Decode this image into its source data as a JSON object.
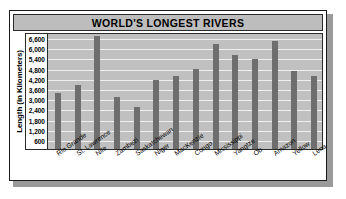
{
  "figure": {
    "title": "WORLD'S LONGEST RIVERS"
  },
  "axes": {
    "ylabel": "Length (in Kilometers)",
    "ytick_labels": [
      "6,600",
      "6,000",
      "5,400",
      "4,800",
      "4,200",
      "3,600",
      "3,000",
      "2,400",
      "1,800",
      "1,200",
      "600"
    ]
  },
  "colors": {
    "bar": "#6e6e6e",
    "plot_background": "#c0c0c0",
    "gridline": "#efefef",
    "title_banner": "#bdbdbd",
    "frame": "#1a1a1a"
  },
  "chart_data": {
    "type": "bar",
    "title": "WORLD'S LONGEST RIVERS",
    "xlabel": "",
    "ylabel": "Length (in Kilometers)",
    "ylim": [
      0,
      6900
    ],
    "ytick_values": [
      600,
      1200,
      1800,
      2400,
      3000,
      3600,
      4200,
      4800,
      5400,
      6000,
      6600
    ],
    "grid": true,
    "legend": false,
    "categories": [
      "Rio Grande",
      "St. Lawrence",
      "Nile",
      "Zambezi",
      "Saskatchewan",
      "Niger",
      "MacKenzie",
      "Congo",
      "Mississippi",
      "Yangtze",
      "Ob",
      "Amazon",
      "Yellow",
      "Lena"
    ],
    "values": [
      3300,
      3800,
      6650,
      3050,
      2500,
      4100,
      4300,
      4700,
      6200,
      5550,
      5300,
      6400,
      4600,
      4300
    ]
  }
}
